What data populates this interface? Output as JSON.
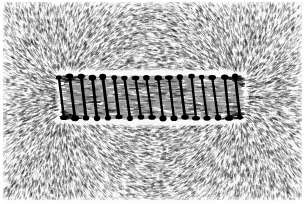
{
  "figure": {
    "title": "Magnetic field of a solenoid revealed by iron filings",
    "subject": "current-carrying coil (solenoid)",
    "medium": "iron filings on paper, photographic halftone",
    "rendering": "monochrome black-and-white scan",
    "width_px": 304,
    "height_px": 204,
    "background_color": "#fdfdfd",
    "filing_color": "#141414",
    "coil_color": "#000000",
    "paper_margin_px": 4
  },
  "plate": {
    "left": 0,
    "top": 0,
    "width": 304,
    "height": 204,
    "border_visible": false
  },
  "coil": {
    "label": "solenoid winding",
    "turn_count": 17,
    "x_start": 64,
    "x_end": 240,
    "y_top": 77,
    "y_bottom": 118,
    "turn_spacing_px": 11,
    "wire_thickness_px": 2.6,
    "lean_px": -5,
    "terminal_dot_radius_px": 3.2,
    "terminal_dot_color": "#000000",
    "halo_color": "#ffffff",
    "halo_pad_px": 7,
    "axis_y": 97.5
  },
  "poles": [
    {
      "name": "left-pole",
      "x": 62,
      "y": 97,
      "polarity": "N",
      "radial": true
    },
    {
      "name": "right-pole",
      "x": 242,
      "y": 97,
      "polarity": "S",
      "radial": true
    }
  ],
  "field": {
    "description": "dipole field: uniform axial lines inside the coil, fanning radially outward from each end and looping around the exterior",
    "interior_alignment": "horizontal / axial",
    "exterior_alignment": "looping return flux",
    "filing_count": 17000,
    "filing_length_min_px": 1.6,
    "filing_length_max_px": 6.5,
    "filing_width_px": 0.85,
    "density_core": 1.0,
    "density_edge": 0.55
  },
  "chart_data": {
    "type": "scatter",
    "title": "Magnetic field of a solenoid revealed by iron filings",
    "xlabel": "",
    "ylabel": "",
    "xlim": [
      0,
      304
    ],
    "ylim": [
      0,
      204
    ],
    "grid": false,
    "legend": "none",
    "annotations": [
      "17 coil turns drawn as leaning dark bars with heavy terminal dots",
      "uniform horizontal filings inside the solenoid bore",
      "radial fan of filings at the left pole",
      "radial fan of filings at the right pole",
      "flux return loops above and below the coil",
      "white exclusion halo immediately around the winding"
    ]
  }
}
